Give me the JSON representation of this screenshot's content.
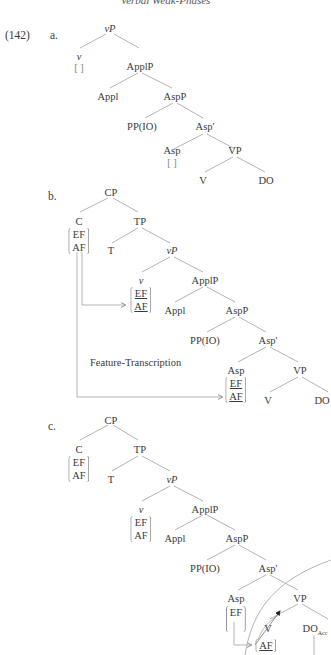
{
  "header": {
    "running_title": "Verbal Weak-Phases"
  },
  "example": {
    "number": "(142)",
    "a": {
      "label": "a.",
      "nodes": {
        "vP": "vP",
        "v": "v",
        "ApplP": "ApplP",
        "Appl": "Appl",
        "AspP": "AspP",
        "PP": "PP(IO)",
        "AspBar": "Asp'",
        "Asp": "Asp",
        "VP": "VP",
        "V": "V",
        "DO": "DO"
      },
      "empty_bracket": "[ ]"
    },
    "b": {
      "label": "b.",
      "nodes": {
        "CP": "CP",
        "C": "C",
        "TP": "TP",
        "T": "T",
        "vP": "vP",
        "v": "v",
        "ApplP": "ApplP",
        "Appl": "Appl",
        "AspP": "AspP",
        "PP": "PP(IO)",
        "AspBar": "Asp'",
        "Asp": "Asp",
        "VP": "VP",
        "V": "V",
        "DO": "DO"
      },
      "features": {
        "EF": "EF",
        "AF": "AF"
      },
      "annotation": "Feature-Transcription"
    },
    "c": {
      "label": "c.",
      "nodes": {
        "CP": "CP",
        "C": "C",
        "TP": "TP",
        "T": "T",
        "vP": "vP",
        "v": "v",
        "ApplP": "ApplP",
        "Appl": "Appl",
        "AspP": "AspP",
        "PP": "PP(IO)",
        "AspBar": "Asp'",
        "Asp": "Asp",
        "VP": "VP",
        "V": "V",
        "DO": "DO",
        "DO_sub": "Acc"
      },
      "features": {
        "EF": "EF",
        "AF": "AF"
      }
    }
  }
}
